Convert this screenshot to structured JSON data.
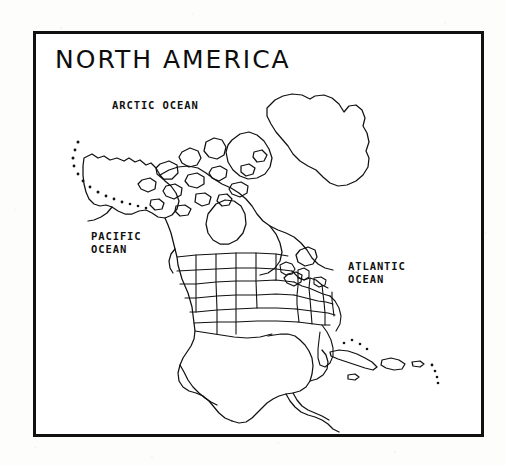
{
  "document": {
    "type": "outline-map",
    "title": "NORTH AMERICA",
    "background_color": "#fdfdfb",
    "ink_color": "#111111",
    "frame_color": "#111111"
  },
  "map": {
    "title": "NORTH AMERICA",
    "region": "North America",
    "style": "black and white line outline map with US state boundaries",
    "labels": [
      {
        "name": "arctic-ocean",
        "text": "ARCTIC OCEAN"
      },
      {
        "name": "pacific-ocean",
        "text": "PACIFIC\nOCEAN"
      },
      {
        "name": "atlantic-ocean",
        "text": "ATLANTIC\nOCEAN"
      }
    ],
    "features": [
      "Alaska",
      "Aleutian Islands",
      "Canada",
      "Hudson Bay",
      "Greenland",
      "Canadian Arctic Archipelago",
      "Baffin Island",
      "Newfoundland",
      "Nova Scotia",
      "United States state boundaries",
      "Baja California",
      "Mexico",
      "Gulf of Mexico",
      "Yucatan Peninsula",
      "Florida",
      "Great Lakes",
      "Cuba",
      "Hispaniola",
      "Puerto Rico",
      "Central America",
      "Panama"
    ]
  }
}
